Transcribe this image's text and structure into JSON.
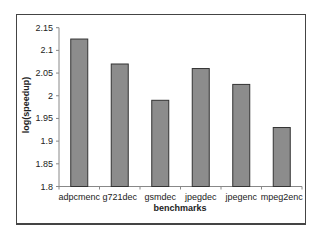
{
  "chart_data": {
    "type": "bar",
    "title": "",
    "xlabel": "benchmarks",
    "ylabel": "log(speedup)",
    "categories": [
      "adpcmenc",
      "g721dec",
      "gsmdec",
      "jpegdec",
      "jpegenc",
      "mpeg2enc"
    ],
    "values": [
      2.125,
      2.07,
      1.99,
      2.06,
      2.025,
      1.93
    ],
    "ylim": [
      1.8,
      2.15
    ],
    "yticks": [
      "1.8",
      "1.85",
      "1.9",
      "1.95",
      "2",
      "2.05",
      "2.1",
      "2.15"
    ],
    "grid": false,
    "legend": null,
    "bar_color": "#8c8c8c",
    "bar_edge_color": "#333333"
  }
}
